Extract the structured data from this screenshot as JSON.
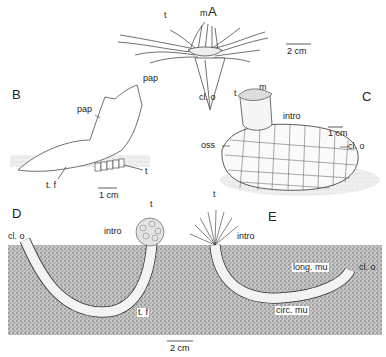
{
  "figure": {
    "panels": [
      {
        "id": "A",
        "label": "A",
        "scale": "2 cm",
        "annotations": {
          "t": "t",
          "m": "m",
          "pap": "pap",
          "cl_o": "cl. o"
        }
      },
      {
        "id": "B",
        "label": "B",
        "scale": "1 cm",
        "annotations": {
          "pap": "pap",
          "t": "t",
          "t_f": "t. f"
        }
      },
      {
        "id": "C",
        "label": "C",
        "scale": "1 cm",
        "annotations": {
          "t": "t",
          "m": "m",
          "intro": "intro",
          "oss": "oss",
          "cl_o": "cl. o"
        }
      },
      {
        "id": "D",
        "label": "D",
        "annotations": {
          "t": "t",
          "intro": "intro",
          "cl_o": "cl. o",
          "t_f": "t. f"
        }
      },
      {
        "id": "E",
        "label": "E",
        "annotations": {
          "t": "t",
          "intro": "intro",
          "long_mu": "long. mu",
          "cl_o": "cl. o",
          "circ_mu": "circ. mu"
        }
      }
    ],
    "shared_scale": "2 cm",
    "colors": {
      "ink": "#222222",
      "sediment": "#9a9a9a",
      "background": "#ffffff"
    }
  }
}
